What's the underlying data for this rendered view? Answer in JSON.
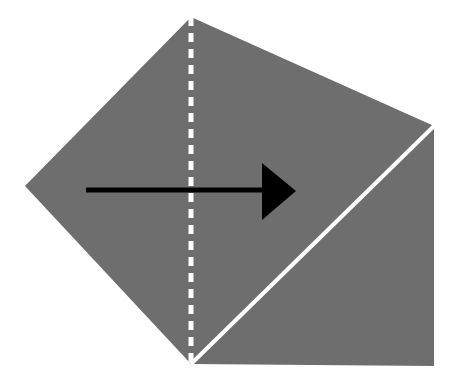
{
  "figure": {
    "background_color": "#ffffff",
    "paper_color": "#6e6e6e",
    "fold_line_color": "#ffffff",
    "crease_line_color": "#ffffff",
    "arrow_color": "#000000"
  },
  "shapes": {
    "paper_polygon": {
      "name": "folded-paper-pentagon",
      "points": "191,17 434,126 434,366 191,364 25,186",
      "fill": "#6e6e6e"
    },
    "fold_line": {
      "name": "vertical-fold-dashed-line",
      "x1": 191,
      "y1": 17,
      "x2": 191,
      "y2": 364,
      "stroke": "#ffffff",
      "stroke_width": 5,
      "dash_pattern": "9 7"
    },
    "crease_line": {
      "name": "diagonal-crease-line",
      "x1": 191,
      "y1": 364,
      "x2": 434,
      "y2": 126,
      "stroke": "#ffffff",
      "stroke_width": 4
    },
    "arrow": {
      "name": "fold-direction-arrow",
      "shaft_x1": 86,
      "shaft_y1": 190,
      "shaft_x2": 268,
      "shaft_y2": 190,
      "shaft_width": 5,
      "head_points": "262,163 296,191 262,220",
      "fill": "#000000",
      "direction": "right"
    }
  },
  "labels": {
    "alt_text": "Gray pentagon sheet with a white vertical dashed fold line, a white diagonal crease, and a black rightward arrow showing the fold direction."
  }
}
